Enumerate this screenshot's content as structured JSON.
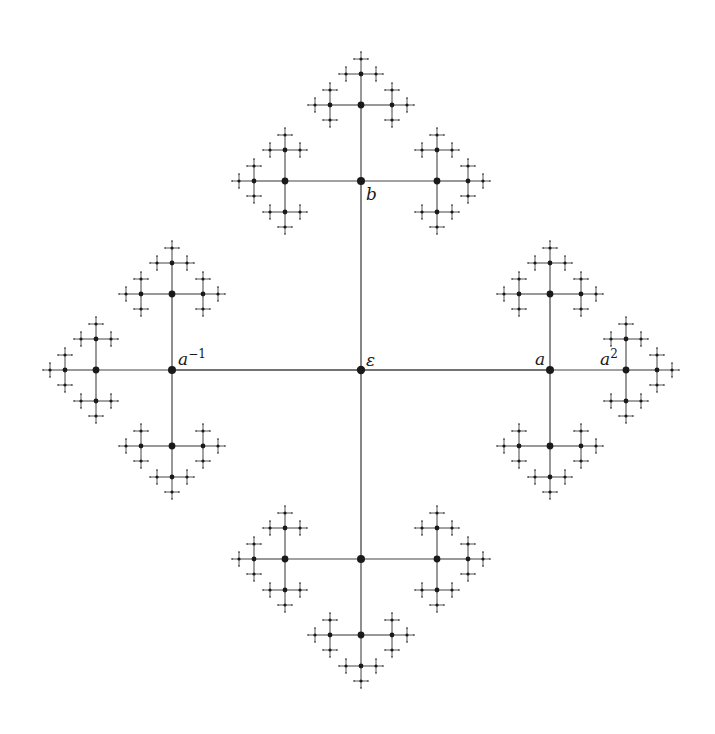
{
  "diagram": {
    "type": "fractal-tree",
    "root": {
      "x": 361,
      "y": 370
    },
    "generators": [
      "a",
      "b"
    ],
    "edge_lengths": [
      189,
      76,
      31,
      15,
      7
    ],
    "node_radii": [
      4.2,
      4.0,
      3.4,
      2.4,
      1.6,
      0.8
    ],
    "depth": 5,
    "line_color": "#444444",
    "node_color": "#1a1a1a",
    "line_width": 1.3
  },
  "labels": {
    "identity": {
      "base": "ε",
      "sup": "",
      "x": 366,
      "y": 366
    },
    "a": {
      "base": "a",
      "sup": "",
      "x": 535,
      "y": 365
    },
    "a2": {
      "base": "a",
      "sup": "2",
      "x": 600,
      "y": 365
    },
    "a_inv": {
      "base": "a",
      "sup": "−1",
      "x": 178,
      "y": 365
    },
    "b": {
      "base": "b",
      "sup": "",
      "x": 366,
      "y": 200
    }
  }
}
